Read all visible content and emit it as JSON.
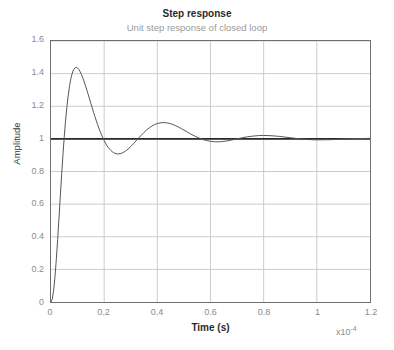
{
  "chart_data": {
    "type": "line",
    "title": "Step response",
    "subtitle": "Unit step response of closed loop",
    "xlabel": "Time (s)",
    "ylabel": "Amplitude",
    "x_exponent_label": "x10",
    "x_exponent_power": "-4",
    "xlim": [
      0,
      1.2
    ],
    "ylim": [
      0,
      1.6
    ],
    "xticks": [
      "0",
      "0.2",
      "0.4",
      "0.6",
      "0.8",
      "1",
      "1.2"
    ],
    "xtick_values": [
      0,
      0.2,
      0.4,
      0.6,
      0.8,
      1.0,
      1.2
    ],
    "yticks": [
      "0",
      "0.2",
      "0.4",
      "0.6",
      "0.8",
      "1",
      "1.2",
      "1.4",
      "1.6"
    ],
    "ytick_values": [
      0,
      0.2,
      0.4,
      0.6,
      0.8,
      1.0,
      1.2,
      1.4,
      1.6
    ],
    "grid": true,
    "legend": "none",
    "curve_color": "#555555",
    "reference_line_color": "#2a2a2a",
    "grid_color": "#cccccc",
    "axis_color": "#6f6f6f",
    "reference_line_value": 1.0,
    "series": [
      {
        "name": "step response",
        "annotations": {
          "overshoot_peak_1": {
            "x": 0.102,
            "y": 1.6
          },
          "trough_1": {
            "x": 0.208,
            "y": 0.632
          },
          "peak_2": {
            "x": 0.305,
            "y": 1.222
          },
          "trough_2": {
            "x": 0.405,
            "y": 0.855
          },
          "peak_3": {
            "x": 0.505,
            "y": 1.098
          },
          "trough_3": {
            "x": 0.605,
            "y": 0.94
          },
          "peak_4": {
            "x": 0.705,
            "y": 1.04
          },
          "steady_state": 1.0
        },
        "x": [
          0,
          0.005,
          0.01,
          0.015,
          0.02,
          0.025,
          0.03,
          0.035,
          0.04,
          0.045,
          0.05,
          0.055,
          0.06,
          0.065,
          0.07,
          0.075,
          0.08,
          0.085,
          0.09,
          0.095,
          0.1,
          0.105,
          0.11,
          0.115,
          0.12,
          0.125,
          0.13,
          0.135,
          0.14,
          0.145,
          0.15,
          0.155,
          0.16,
          0.165,
          0.17,
          0.175,
          0.18,
          0.185,
          0.19,
          0.195,
          0.2,
          0.205,
          0.21,
          0.215,
          0.22,
          0.225,
          0.23,
          0.235,
          0.24,
          0.245,
          0.25,
          0.26,
          0.27,
          0.28,
          0.29,
          0.3,
          0.31,
          0.32,
          0.33,
          0.34,
          0.35,
          0.36,
          0.37,
          0.38,
          0.39,
          0.4,
          0.41,
          0.42,
          0.43,
          0.44,
          0.45,
          0.46,
          0.47,
          0.48,
          0.49,
          0.5,
          0.51,
          0.52,
          0.53,
          0.54,
          0.55,
          0.56,
          0.57,
          0.58,
          0.59,
          0.6,
          0.61,
          0.62,
          0.63,
          0.64,
          0.65,
          0.66,
          0.67,
          0.68,
          0.69,
          0.7,
          0.72,
          0.74,
          0.76,
          0.78,
          0.8,
          0.82,
          0.84,
          0.86,
          0.88,
          0.9,
          0.92,
          0.94,
          0.96,
          0.98,
          1.0,
          1.05,
          1.1,
          1.15,
          1.2
        ],
        "y": [
          0,
          0.019,
          0.072,
          0.155,
          0.261,
          0.383,
          0.514,
          0.648,
          0.779,
          0.903,
          1.016,
          1.115,
          1.2,
          1.27,
          1.327,
          1.371,
          1.403,
          1.424,
          1.435,
          1.438,
          1.435,
          1.425,
          1.411,
          1.393,
          1.372,
          1.349,
          1.324,
          1.298,
          1.272,
          1.245,
          1.218,
          1.191,
          1.164,
          1.138,
          1.113,
          1.089,
          1.066,
          1.045,
          1.025,
          1.006,
          0.989,
          0.974,
          0.96,
          0.948,
          0.938,
          0.929,
          0.922,
          0.916,
          0.912,
          0.909,
          0.908,
          0.909,
          0.915,
          0.925,
          0.938,
          0.953,
          0.97,
          0.988,
          1.006,
          1.023,
          1.04,
          1.055,
          1.068,
          1.079,
          1.088,
          1.094,
          1.098,
          1.1,
          1.099,
          1.097,
          1.093,
          1.087,
          1.08,
          1.072,
          1.063,
          1.054,
          1.045,
          1.035,
          1.026,
          1.018,
          1.01,
          1.003,
          0.997,
          0.992,
          0.988,
          0.985,
          0.983,
          0.982,
          0.982,
          0.983,
          0.985,
          0.987,
          0.99,
          0.993,
          0.997,
          1.0,
          1.007,
          1.013,
          1.017,
          1.02,
          1.021,
          1.02,
          1.018,
          1.015,
          1.011,
          1.007,
          1.003,
          1.0,
          0.997,
          0.995,
          0.994,
          0.995,
          0.999,
          1.002,
          1.003
        ]
      }
    ]
  }
}
